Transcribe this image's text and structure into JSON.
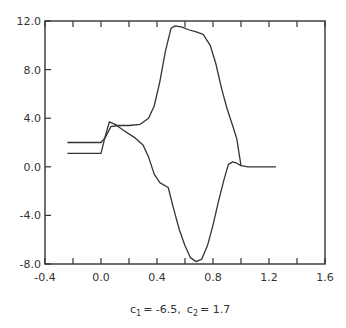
{
  "chart_data": {
    "type": "line",
    "title": "",
    "caption": "c1 = -6.5,  c2 = 1.7",
    "caption_parts": {
      "c1_label": "c",
      "c1_sub": "1",
      "c1_value": "= -6.5,",
      "c2_label": "c",
      "c2_sub": "2",
      "c2_value": "= 1.7"
    },
    "xlabel": "",
    "ylabel": "",
    "xlim": [
      -0.4,
      1.6
    ],
    "ylim": [
      -8.0,
      12.0
    ],
    "grid": false,
    "legend": null,
    "x_ticks": [
      -0.4,
      0.0,
      0.4,
      0.8,
      1.2,
      1.6
    ],
    "x_tick_labels": [
      "-0.4",
      "0.0",
      "0.4",
      "0.8",
      "1.2",
      "1.6"
    ],
    "x_minor_ticks": [
      -0.2,
      0.2,
      0.6,
      1.0,
      1.4
    ],
    "y_ticks": [
      -8.0,
      -4.0,
      0.0,
      4.0,
      8.0,
      12.0
    ],
    "y_tick_labels": [
      "-8.0",
      "-4.0",
      "0.0",
      "4.0",
      "8.0",
      "12.0"
    ],
    "series": [
      {
        "name": "upper curve",
        "points": [
          [
            -0.24,
            2.0
          ],
          [
            0.0,
            2.0
          ],
          [
            0.03,
            2.4
          ],
          [
            0.07,
            3.3
          ],
          [
            0.12,
            3.4
          ],
          [
            0.2,
            3.4
          ],
          [
            0.28,
            3.5
          ],
          [
            0.34,
            4.0
          ],
          [
            0.38,
            5.0
          ],
          [
            0.42,
            7.0
          ],
          [
            0.46,
            9.5
          ],
          [
            0.5,
            11.4
          ],
          [
            0.53,
            11.6
          ],
          [
            0.58,
            11.5
          ],
          [
            0.62,
            11.3
          ],
          [
            0.68,
            11.1
          ],
          [
            0.73,
            10.9
          ],
          [
            0.78,
            10.0
          ],
          [
            0.82,
            8.5
          ],
          [
            0.86,
            6.5
          ],
          [
            0.9,
            4.8
          ],
          [
            0.94,
            3.4
          ],
          [
            0.97,
            2.3
          ],
          [
            1.0,
            0.1
          ],
          [
            1.05,
            0.0
          ],
          [
            1.25,
            0.0
          ]
        ]
      },
      {
        "name": "lower curve",
        "points": [
          [
            -0.24,
            1.1
          ],
          [
            0.0,
            1.1
          ],
          [
            0.03,
            2.5
          ],
          [
            0.06,
            3.7
          ],
          [
            0.1,
            3.5
          ],
          [
            0.16,
            3.0
          ],
          [
            0.24,
            2.4
          ],
          [
            0.3,
            1.8
          ],
          [
            0.34,
            0.8
          ],
          [
            0.38,
            -0.6
          ],
          [
            0.42,
            -1.3
          ],
          [
            0.48,
            -1.7
          ],
          [
            0.52,
            -3.5
          ],
          [
            0.56,
            -5.2
          ],
          [
            0.6,
            -6.5
          ],
          [
            0.64,
            -7.5
          ],
          [
            0.68,
            -7.8
          ],
          [
            0.72,
            -7.6
          ],
          [
            0.76,
            -6.5
          ],
          [
            0.8,
            -4.8
          ],
          [
            0.84,
            -2.8
          ],
          [
            0.88,
            -1.0
          ],
          [
            0.91,
            0.2
          ],
          [
            0.94,
            0.4
          ],
          [
            0.97,
            0.3
          ],
          [
            1.0,
            0.1
          ]
        ]
      }
    ]
  }
}
